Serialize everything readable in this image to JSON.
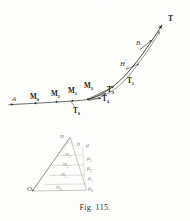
{
  "figure": {
    "caption": "Fig. 115.",
    "background_color": "#fdfdfc",
    "ink_color": "#2b2b28",
    "faint_ink_color": "#9a9a92"
  },
  "trajectory_labels": {
    "start_point": "A",
    "terminal_point": "T",
    "upper_branch": "B",
    "h_prime": "H",
    "h_prime_mark": "′",
    "h_prime_sub": "2"
  },
  "position_points": [
    {
      "name": "M0",
      "base": "M",
      "sub": "0"
    },
    {
      "name": "M1",
      "base": "M",
      "sub": "1"
    },
    {
      "name": "M2",
      "base": "M",
      "sub": "2"
    },
    {
      "name": "M3",
      "base": "M",
      "sub": "3"
    }
  ],
  "tangent_vectors": [
    {
      "name": "T0",
      "base": "T",
      "sub": "0"
    },
    {
      "name": "T2",
      "base": "T",
      "sub": "2"
    },
    {
      "name": "T3",
      "base": "T",
      "sub": "3"
    },
    {
      "name": "T4",
      "base": "T",
      "sub": "4"
    }
  ],
  "hodograph": {
    "origin_label": "O",
    "apex_label": "m",
    "apex_sub": "",
    "b_label": "b",
    "m_labels": [
      {
        "base": "m",
        "sub": "3"
      },
      {
        "base": "m",
        "sub": "2"
      },
      {
        "base": "m",
        "sub": "1"
      },
      {
        "base": "m",
        "sub": "0"
      }
    ],
    "mu_labels": [
      {
        "base": "μ",
        "sub": ""
      },
      {
        "base": "μ",
        "sub": "3"
      },
      {
        "base": "μ",
        "sub": "2"
      },
      {
        "base": "μ",
        "sub": "1"
      },
      {
        "base": "μ",
        "sub": "0"
      }
    ]
  },
  "bleed_through": [
    "·",
    "·",
    "·",
    "·",
    "·"
  ]
}
